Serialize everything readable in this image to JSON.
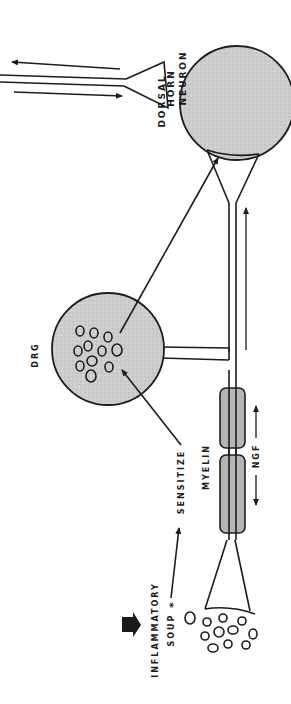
{
  "diagram": {
    "orientation": "rotated 90° (text reads bottom-to-top)",
    "colors": {
      "ink": "#1c1c1c",
      "cell_fill": "#c9c9c9",
      "myelin_fill": "#b5b5b5",
      "background": "#ffffff"
    },
    "labels": {
      "dorsal_horn_line1": "DORSAL",
      "dorsal_horn_line2": "HORN",
      "dorsal_horn_line3": "NEURON",
      "drg": "DRG",
      "sensitize": "SENSITIZE",
      "myelin": "MYELIN",
      "ngf": "NGF",
      "inflammatory_line1": "INFLAMMATORY",
      "inflammatory_line2": "SOUP",
      "asterisk": "*"
    },
    "nodes": [
      {
        "id": "dorsal-horn-neuron",
        "label": "DORSAL HORN NEURON",
        "shape": "circle"
      },
      {
        "id": "drg",
        "label": "DRG",
        "shape": "circle with cell bodies"
      },
      {
        "id": "myelin-sheath",
        "label": "MYELIN",
        "shape": "two capsule segments"
      },
      {
        "id": "peripheral-terminal",
        "label": "",
        "shape": "funnel terminal"
      },
      {
        "id": "inflammatory-soup",
        "label": "INFLAMMATORY SOUP *",
        "shape": "cluster of small ovals"
      }
    ],
    "edges": [
      {
        "from": "inflammatory-soup",
        "to": "sensitize",
        "type": "arrow"
      },
      {
        "from": "sensitize",
        "to": "drg",
        "type": "arrow"
      },
      {
        "from": "drg",
        "to": "dorsal-horn-neuron",
        "type": "arrow"
      },
      {
        "from": "peripheral-terminal",
        "to": "dorsal-horn-neuron",
        "type": "axon with upward arrow"
      },
      {
        "from": "ngf",
        "to": "both directions",
        "type": "double arrow"
      },
      {
        "from": "dorsal-horn-neuron",
        "to": "ascending tract",
        "type": "arrows in/out"
      }
    ]
  }
}
